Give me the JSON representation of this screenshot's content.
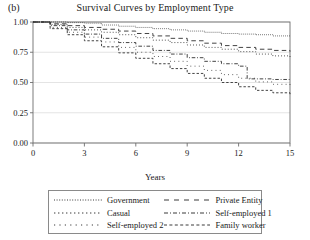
{
  "panel_label": "(b)",
  "title": "Survival Curves by Employment Type",
  "axis": {
    "xlabel": "Years",
    "ylabel": "",
    "x_ticks": [
      "0",
      "3",
      "6",
      "9",
      "12",
      "15"
    ],
    "y_ticks": [
      "0.00",
      "0.25",
      "0.50",
      "0.75",
      "1.00"
    ]
  },
  "legend": {
    "entries": [
      {
        "label": "Government",
        "style": "dotted-fine",
        "column": "left"
      },
      {
        "label": "Casual",
        "style": "dotted-med",
        "column": "left"
      },
      {
        "label": "Self-employed 2",
        "style": "dotted-sparse",
        "column": "left"
      },
      {
        "label": "Private Entity",
        "style": "dash-long",
        "column": "right"
      },
      {
        "label": "Self-employed 1",
        "style": "dash-dot",
        "column": "right"
      },
      {
        "label": "Family worker",
        "style": "dash-short",
        "column": "right"
      }
    ]
  },
  "colors": {
    "line": "#3a3a3a",
    "axis": "#6e6e6e",
    "grid": "#d8d8d8",
    "background": "#ffffff",
    "text": "#1a1a1a"
  },
  "chart_data": {
    "type": "line",
    "title": "Survival Curves by Employment Type",
    "subtitle": "",
    "xlabel": "Years",
    "ylabel": "",
    "xlim": [
      0,
      15
    ],
    "ylim": [
      0,
      1
    ],
    "x_ticks": [
      0,
      3,
      6,
      9,
      12,
      15
    ],
    "y_ticks": [
      0.0,
      0.25,
      0.5,
      0.75,
      1.0
    ],
    "grid": "horizontal",
    "legend_position": "below",
    "step_type": "post",
    "series": [
      {
        "name": "Government",
        "style": "dotted-fine",
        "x": [
          0,
          1,
          2,
          3,
          4,
          5,
          6,
          7,
          8,
          9,
          10,
          11,
          12,
          13,
          14,
          15
        ],
        "values": [
          1.0,
          1.0,
          0.995,
          0.99,
          0.975,
          0.965,
          0.955,
          0.945,
          0.935,
          0.925,
          0.915,
          0.905,
          0.9,
          0.895,
          0.885,
          0.88
        ]
      },
      {
        "name": "Private Entity",
        "style": "dash-long",
        "x": [
          0,
          1,
          2,
          3,
          4,
          5,
          6,
          7,
          8,
          9,
          10,
          11,
          12,
          13,
          14,
          15
        ],
        "values": [
          1.0,
          0.985,
          0.97,
          0.955,
          0.94,
          0.925,
          0.905,
          0.885,
          0.865,
          0.845,
          0.825,
          0.805,
          0.79,
          0.775,
          0.765,
          0.755
        ]
      },
      {
        "name": "Casual",
        "style": "dotted-med",
        "x": [
          0,
          1,
          2,
          3,
          4,
          5,
          6,
          7,
          8,
          9,
          10,
          11,
          12,
          13,
          14,
          15
        ],
        "values": [
          1.0,
          0.98,
          0.955,
          0.935,
          0.915,
          0.895,
          0.87,
          0.85,
          0.83,
          0.81,
          0.79,
          0.775,
          0.755,
          0.735,
          0.72,
          0.705
        ]
      },
      {
        "name": "Self-employed 1",
        "style": "dash-dot",
        "x": [
          0,
          1,
          2,
          3,
          4,
          5,
          6,
          7,
          8,
          9,
          10,
          11,
          12,
          12.5,
          13,
          14,
          15
        ],
        "values": [
          1.0,
          0.97,
          0.935,
          0.9,
          0.865,
          0.83,
          0.8,
          0.765,
          0.735,
          0.705,
          0.675,
          0.655,
          0.635,
          0.53,
          0.53,
          0.525,
          0.525
        ]
      },
      {
        "name": "Self-employed 2",
        "style": "dotted-sparse",
        "x": [
          0,
          1,
          2,
          3,
          4,
          5,
          6,
          7,
          8,
          9,
          10,
          11,
          12,
          13,
          14,
          15
        ],
        "values": [
          1.0,
          0.955,
          0.915,
          0.875,
          0.835,
          0.79,
          0.75,
          0.715,
          0.675,
          0.635,
          0.6,
          0.565,
          0.535,
          0.505,
          0.485,
          0.47
        ]
      },
      {
        "name": "Family worker",
        "style": "dash-short",
        "x": [
          0,
          1,
          2,
          3,
          4,
          5,
          6,
          7,
          8,
          9,
          10,
          11,
          12,
          13,
          14,
          15
        ],
        "values": [
          1.0,
          0.945,
          0.895,
          0.845,
          0.795,
          0.745,
          0.7,
          0.655,
          0.615,
          0.575,
          0.535,
          0.5,
          0.465,
          0.435,
          0.415,
          0.4
        ]
      }
    ]
  }
}
